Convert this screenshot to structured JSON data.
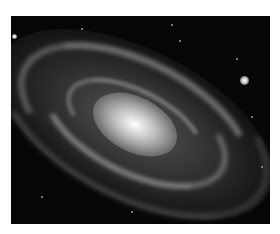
{
  "image": {
    "subject": "spiral galaxy",
    "style": "grayscale astronomical photograph",
    "colors": {
      "page_background": "#ffffff",
      "sky": "#060606",
      "core": "#ffffff"
    }
  }
}
